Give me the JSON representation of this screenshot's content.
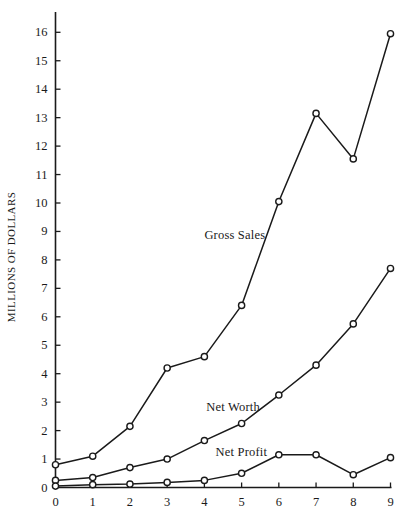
{
  "chart_data": {
    "type": "line",
    "title": "",
    "xlabel": "",
    "ylabel": "MILLIONS OF DOLLARS",
    "x": [
      0,
      1,
      2,
      3,
      4,
      5,
      6,
      7,
      8,
      9
    ],
    "xlim": [
      0,
      9
    ],
    "ylim": [
      0,
      16.6
    ],
    "grid": false,
    "legend_position": "inline-annotations",
    "xticks": [
      "0",
      "1",
      "2",
      "3",
      "4",
      "5",
      "6",
      "7",
      "8",
      "9"
    ],
    "yticks": [
      "0",
      "1",
      "2",
      "3",
      "4",
      "5",
      "6",
      "7",
      "8",
      "9",
      "10",
      "11",
      "12",
      "13",
      "14",
      "15",
      "16"
    ],
    "marker": "open-circle",
    "line_color": "#1a1a1a",
    "series": [
      {
        "name": "Gross Sales",
        "values": [
          0.8,
          1.1,
          2.15,
          4.2,
          4.6,
          6.4,
          10.05,
          13.15,
          11.55,
          15.95
        ],
        "label_x": 4.0,
        "label_y": 8.85
      },
      {
        "name": "Net Worth",
        "values": [
          0.25,
          0.35,
          0.7,
          1.0,
          1.65,
          2.25,
          3.25,
          4.3,
          5.75,
          7.7
        ],
        "label_x": 4.05,
        "label_y": 2.78
      },
      {
        "name": "Net Profit",
        "values": [
          0.05,
          0.1,
          0.12,
          0.18,
          0.25,
          0.5,
          1.15,
          1.15,
          0.45,
          1.05
        ],
        "label_x": 4.3,
        "label_y": 1.2
      }
    ]
  }
}
